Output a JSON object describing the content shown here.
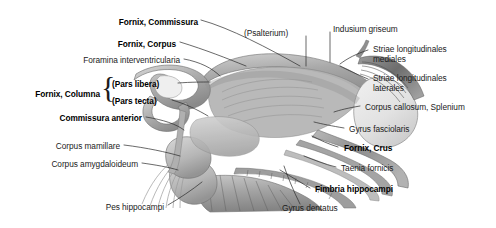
{
  "figure": {
    "background_color": "#ffffff",
    "text_color": "#1b1b1b",
    "leader_line_color": "#2a2a2a"
  },
  "labels": {
    "fornix_commissura": "Fornix, Commissura",
    "fornix_corpus": "Fornix, Corpus",
    "foramina_interventricularia": "Foramina interventricularia",
    "fornix_columna": "Fornix, Columna",
    "pars_libera": "(Pars libera)",
    "pars_tecta": "(Pars tecta)",
    "commissura_anterior": "Commissura anterior",
    "corpus_mamillare": "Corpus mamillare",
    "corpus_amygdaloideum": "Corpus amygdaloideum",
    "pes_hippocampi": "Pes hippocampi",
    "psalterium": "(Psalterium)",
    "indusium_griseum": "Indusium griseum",
    "striae_mediales_l1": "Striae longitudinales",
    "striae_mediales_l2": "mediales",
    "striae_laterales_l1": "Striae longitudinales",
    "striae_laterales_l2": "laterales",
    "corpus_callosum_splenium": "Corpus callosum, Splenium",
    "gyrus_fasciolaris": "Gyrus fasciolaris",
    "fornix_crus": "Fornix, Crus",
    "taenia_fornicis": "Taenia fornicis",
    "fimbria_hippocampi": "Fimbria hippocampi",
    "gyrus_dentatus": "Gyrus dentatus",
    "brace_glyph": "{"
  }
}
